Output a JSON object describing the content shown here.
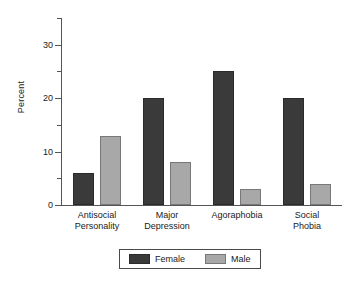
{
  "chart_data": {
    "type": "bar",
    "title": "",
    "subtitle": "",
    "xlabel": "",
    "ylabel": "Percent",
    "ylim": [
      0,
      35
    ],
    "yticks": [
      0,
      5,
      10,
      15,
      20,
      25,
      30,
      35
    ],
    "ytick_labels": [
      "0",
      "",
      "10",
      "",
      "20",
      "",
      "30",
      ""
    ],
    "grid": false,
    "legend_position": "bottom-center",
    "categories": [
      "Antisocial Personality",
      "Major Depression",
      "Agoraphobia",
      "Social Phobia"
    ],
    "category_lines": [
      [
        "Antisocial",
        "Personality"
      ],
      [
        "Major",
        "Depression"
      ],
      [
        "Agoraphobia",
        ""
      ],
      [
        "Social",
        "Phobia"
      ]
    ],
    "series": [
      {
        "name": "Female",
        "color": "#3a3a3a",
        "values": [
          6,
          20,
          25,
          20
        ]
      },
      {
        "name": "Male",
        "color": "#a8a8a8",
        "values": [
          13,
          8,
          3,
          4
        ]
      }
    ]
  },
  "axis": {
    "y_title": "Percent",
    "tick_0": "0",
    "tick_10": "10",
    "tick_20": "20",
    "tick_30": "30"
  },
  "legend": {
    "female_label": "Female",
    "male_label": "Male"
  },
  "labels": {
    "cat0_line1": "Antisocial",
    "cat0_line2": "Personality",
    "cat1_line1": "Major",
    "cat1_line2": "Depression",
    "cat2_line1": "Agoraphobia",
    "cat2_line2": "",
    "cat3_line1": "Social",
    "cat3_line2": "Phobia"
  }
}
